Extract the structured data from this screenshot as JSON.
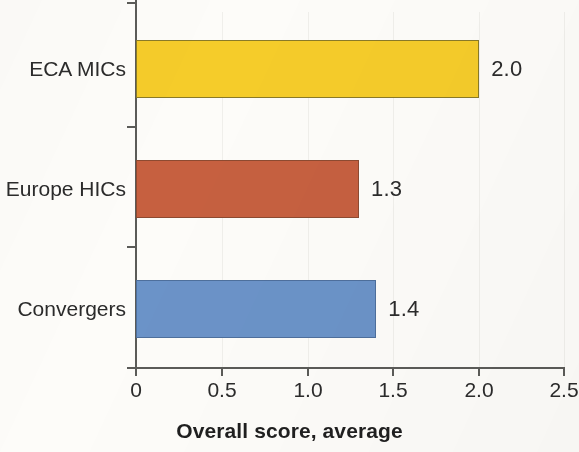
{
  "chart_data": {
    "type": "bar",
    "orientation": "horizontal",
    "title": "",
    "xlabel": "Overall score, average",
    "ylabel": "",
    "categories": [
      "ECA MICs",
      "Europe HICs",
      "Convergers"
    ],
    "values": [
      2.0,
      1.3,
      1.4
    ],
    "value_labels": [
      "2.0",
      "1.3",
      "1.4"
    ],
    "colors": [
      "#f5cc2a",
      "#c66040",
      "#6b93c8"
    ],
    "xlim": [
      0,
      2.5
    ],
    "xticks": [
      0,
      0.5,
      1.0,
      1.5,
      2.0,
      2.5
    ],
    "xtick_labels": [
      "0",
      "0.5",
      "1.0",
      "1.5",
      "2.0",
      "2.5"
    ],
    "grid": "faint vertical gridlines at x ticks",
    "legend": "none",
    "series": [
      {
        "name": "Overall score, average",
        "points": [
          {
            "category": "ECA MICs",
            "value": 2.0,
            "label": "2.0",
            "color": "#f5cc2a"
          },
          {
            "category": "Europe HICs",
            "value": 1.3,
            "label": "1.3",
            "color": "#c66040"
          },
          {
            "category": "Convergers",
            "value": 1.4,
            "label": "1.4",
            "color": "#6b93c8"
          }
        ]
      }
    ]
  },
  "axis": {
    "title": "Overall score, average",
    "tick_0": "0",
    "tick_1": "0.5",
    "tick_2": "1.0",
    "tick_3": "1.5",
    "tick_4": "2.0",
    "tick_5": "2.5"
  },
  "bars": {
    "b0": {
      "label": "ECA MICs",
      "value": "2.0"
    },
    "b1": {
      "label": "Europe HICs",
      "value": "1.3"
    },
    "b2": {
      "label": "Convergers",
      "value": "1.4"
    }
  }
}
